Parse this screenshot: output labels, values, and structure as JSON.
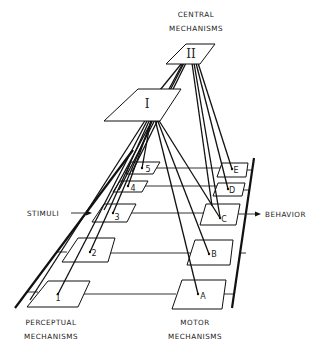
{
  "diagram": {
    "central_label": {
      "line1": "CENTRAL",
      "line2": "MECHANISMS"
    },
    "perceptual_label": {
      "line1": "PERCEPTUAL",
      "line2": "MECHANISMS"
    },
    "motor_label": {
      "line1": "MOTOR",
      "line2": "MECHANISMS"
    },
    "input_label": "STIMULI",
    "output_label": "BEHAVIOR",
    "central_nodes": [
      {
        "id": "I",
        "label": "I"
      },
      {
        "id": "II",
        "label": "II"
      }
    ],
    "perceptual_nodes": [
      {
        "id": "1",
        "label": "1"
      },
      {
        "id": "2",
        "label": "2"
      },
      {
        "id": "3",
        "label": "3"
      },
      {
        "id": "4",
        "label": "4"
      },
      {
        "id": "5",
        "label": "5"
      }
    ],
    "motor_nodes": [
      {
        "id": "A",
        "label": "A"
      },
      {
        "id": "B",
        "label": "B"
      },
      {
        "id": "C",
        "label": "C"
      },
      {
        "id": "D",
        "label": "D"
      },
      {
        "id": "E",
        "label": "E"
      }
    ],
    "connections": [
      [
        "I",
        "1"
      ],
      [
        "I",
        "2"
      ],
      [
        "I",
        "3"
      ],
      [
        "I",
        "4"
      ],
      [
        "I",
        "5"
      ],
      [
        "I",
        "A"
      ],
      [
        "I",
        "B"
      ],
      [
        "I",
        "C"
      ],
      [
        "II",
        "3"
      ],
      [
        "II",
        "4"
      ],
      [
        "II",
        "5"
      ],
      [
        "II",
        "C"
      ],
      [
        "II",
        "D"
      ],
      [
        "II",
        "E"
      ],
      [
        "1",
        "A"
      ],
      [
        "2",
        "B"
      ],
      [
        "3",
        "C"
      ],
      [
        "4",
        "D"
      ],
      [
        "5",
        "E"
      ]
    ]
  }
}
